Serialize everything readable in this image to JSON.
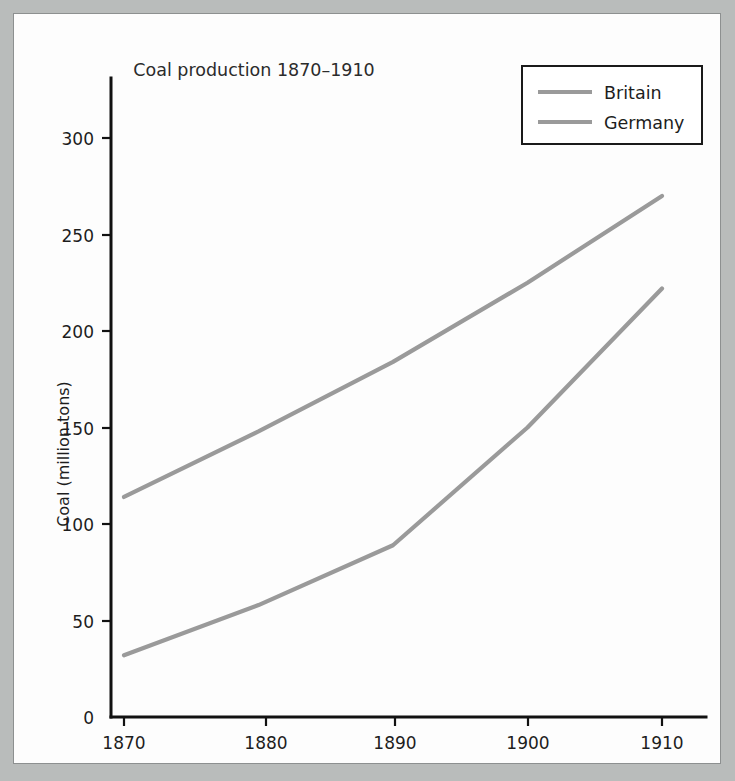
{
  "figure": {
    "frame_border_color": "#8d9090",
    "background_color": "#fdfdfd",
    "page_background_color": "#b9bcbb"
  },
  "chart_data": {
    "type": "line",
    "title": "Coal production 1870–1910",
    "xlabel": "",
    "ylabel": "Coal (million tons)",
    "x": [
      1870,
      1880,
      1890,
      1900,
      1910
    ],
    "categories": [
      "1870",
      "1880",
      "1890",
      "1900",
      "1910"
    ],
    "series": [
      {
        "name": "Britain",
        "values": [
          114,
          148,
          184,
          225,
          270
        ],
        "color": "#9a9a9a"
      },
      {
        "name": "Germany",
        "values": [
          32,
          58,
          89,
          150,
          222
        ],
        "color": "#9a9a9a"
      }
    ],
    "xlim": [
      1868,
      1913
    ],
    "ylim": [
      0,
      320
    ],
    "xticks": [
      "1870",
      "1880",
      "1890",
      "1900",
      "1910"
    ],
    "yticks": [
      "0",
      "50",
      "100",
      "150",
      "200",
      "250",
      "300"
    ],
    "ytick_values": [
      0,
      50,
      100,
      150,
      200,
      250,
      300
    ],
    "grid": false,
    "legend_position": "top-right",
    "legend_entries": [
      "Britain",
      "Germany"
    ]
  }
}
